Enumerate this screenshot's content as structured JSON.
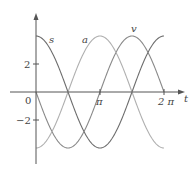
{
  "chart_data": {
    "type": "line",
    "title": "",
    "xlabel": "t",
    "ylabel": "",
    "xlim": [
      0,
      6.6
    ],
    "ylim": [
      -4.5,
      5.5
    ],
    "x_ticks": [
      {
        "value": 3.14159,
        "label": "π"
      },
      {
        "value": 6.28318,
        "label": "2 π"
      }
    ],
    "y_ticks": [
      {
        "value": 2,
        "label": "2"
      },
      {
        "value": -2,
        "label": "−2"
      }
    ],
    "origin_label": "0",
    "grid": false,
    "legend": "inline labels",
    "series": [
      {
        "name": "s",
        "formula": "4cos(t)",
        "color": "#6e6e6e",
        "x": [
          0,
          0.785,
          1.571,
          2.356,
          3.142,
          3.927,
          4.712,
          5.498,
          6.283
        ],
        "values": [
          4,
          2.83,
          0,
          -2.83,
          -4,
          -2.83,
          0,
          2.83,
          4
        ]
      },
      {
        "name": "v",
        "formula": "-4sin(t)",
        "color": "#8a8a8a",
        "x": [
          0,
          0.785,
          1.571,
          2.356,
          3.142,
          3.927,
          4.712,
          5.498,
          6.283
        ],
        "values": [
          0,
          -2.83,
          -4,
          -2.83,
          0,
          2.83,
          4,
          2.83,
          0
        ]
      },
      {
        "name": "a",
        "formula": "-4cos(t)",
        "color": "#b0b0b0",
        "x": [
          0,
          0.785,
          1.571,
          2.356,
          3.142,
          3.927,
          4.712,
          5.498,
          6.283
        ],
        "values": [
          -4,
          -2.83,
          0,
          2.83,
          4,
          2.83,
          0,
          -2.83,
          -4
        ]
      }
    ]
  },
  "labels": {
    "s": "s",
    "a": "a",
    "v": "v",
    "t_axis": "t",
    "origin": "0",
    "pi": "π",
    "two_pi": "2 π",
    "y_pos": "2",
    "y_neg": "−2"
  }
}
